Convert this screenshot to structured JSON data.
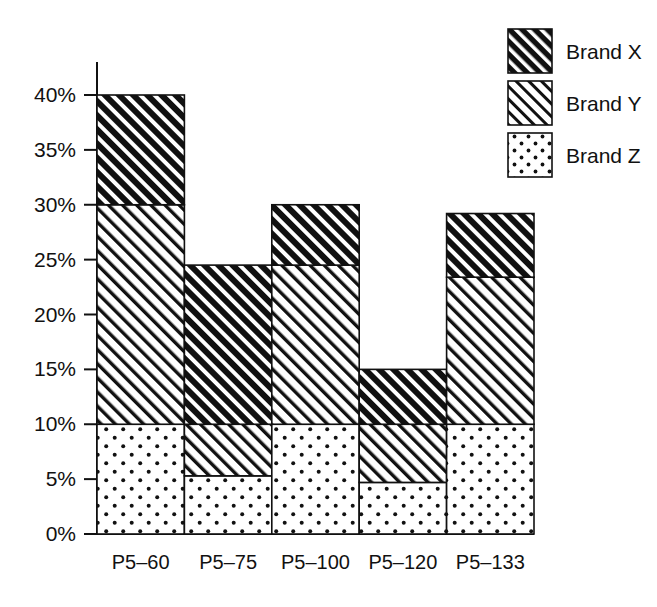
{
  "chart_data": {
    "type": "bar",
    "subtype": "stacked-bar",
    "title": "",
    "xlabel": "",
    "ylabel": "",
    "categories": [
      "P5–60",
      "P5–75",
      "P5–100",
      "P5–120",
      "P5–133"
    ],
    "series": [
      {
        "name": "Brand X",
        "values": [
          10.0,
          14.5,
          5.5,
          5.0,
          5.8
        ]
      },
      {
        "name": "Brand Y",
        "values": [
          20.0,
          4.7,
          14.5,
          5.3,
          13.4
        ]
      },
      {
        "name": "Brand Z",
        "values": [
          10.0,
          5.3,
          10.0,
          4.7,
          10.0
        ]
      }
    ],
    "stack_order_bottom_to_top": [
      "Brand Z",
      "Brand Y",
      "Brand X"
    ],
    "stack_totals": [
      40.0,
      24.5,
      30.0,
      15.0,
      29.2
    ],
    "ylim": [
      0,
      40
    ],
    "ytick_values": [
      0,
      5,
      10,
      15,
      20,
      25,
      30,
      35,
      40
    ],
    "ytick_labels": [
      "0%",
      "5%",
      "10%",
      "15%",
      "20%",
      "25%",
      "30%",
      "35%",
      "40%"
    ],
    "grid": false,
    "legend_position": "top-right",
    "legend_entries": [
      {
        "label": "Brand X",
        "pattern": "black-with-white-diagonal-hatch"
      },
      {
        "label": "Brand Y",
        "pattern": "white-with-black-diagonal-hatch"
      },
      {
        "label": "Brand Z",
        "pattern": "white-with-black-dots"
      }
    ],
    "colors": {
      "brand_x_fill": "#111111",
      "brand_x_hatch": "#ffffff",
      "brand_y_fill": "#ffffff",
      "brand_y_hatch": "#111111",
      "brand_z_fill": "#ffffff",
      "brand_z_dots": "#111111",
      "axis": "#111111",
      "background": "#ffffff"
    }
  }
}
